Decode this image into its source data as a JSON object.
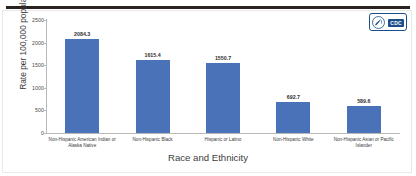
{
  "chart_data": {
    "type": "bar",
    "title": "",
    "xlabel": "Race and Ethnicity",
    "ylabel": "Rate per 100,000 population",
    "ylim": [
      0,
      2500
    ],
    "yticks": [
      0,
      500,
      1000,
      1500,
      2000,
      2500
    ],
    "ytick_labels": [
      "0",
      "500",
      "1000",
      "1500",
      "2000",
      "2500"
    ],
    "grid": false,
    "legend": "none",
    "bar_color": "#4a72b8",
    "categories": [
      "Non-Hispanic American Indian or Alaska Native",
      "Non-Hispanic Black",
      "Hispanic or Latino",
      "Non-Hispanic White",
      "Non-Hispanic Asian or Pacific Islander"
    ],
    "values": [
      2084.3,
      1615.4,
      1550.7,
      692.7,
      589.6
    ],
    "value_labels": [
      "2084.3",
      "1615.4",
      "1550.7",
      "692.7",
      "589.6"
    ]
  },
  "branding": {
    "agency_abbr": "CDC",
    "seal_name": "hhs-seal-icon",
    "logo_color": "#1b4f8a"
  }
}
